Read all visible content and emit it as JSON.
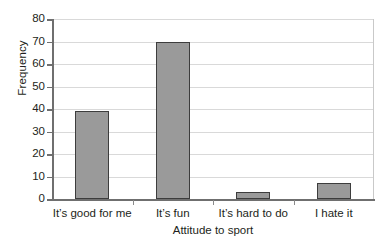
{
  "chart_data": {
    "type": "bar",
    "title": "",
    "subtitle": "",
    "xlabel": "Attitude to sport",
    "ylabel": "Frequency",
    "categories": [
      "It’s good for me",
      "It’s fun",
      "It’s hard to do",
      "I hate it"
    ],
    "values": [
      39,
      70,
      3,
      7
    ],
    "ylim": [
      0,
      80
    ],
    "ytick_labels": [
      "0",
      "10",
      "20",
      "30",
      "40",
      "50",
      "60",
      "70",
      "80"
    ],
    "ytick_values": [
      0,
      10,
      20,
      30,
      40,
      50,
      60,
      70,
      80
    ],
    "grid": "horizontal",
    "legend": "none",
    "series": [
      {
        "name": "Frequency",
        "values": [
          39,
          70,
          3,
          7
        ]
      }
    ],
    "colors": {
      "bar_fill": "#9a9a9a",
      "bar_stroke": "#3d3d3d",
      "gridline": "#d9d9d9",
      "axis": "#6f6f6f",
      "text": "#231f20",
      "background": "#ffffff"
    }
  }
}
